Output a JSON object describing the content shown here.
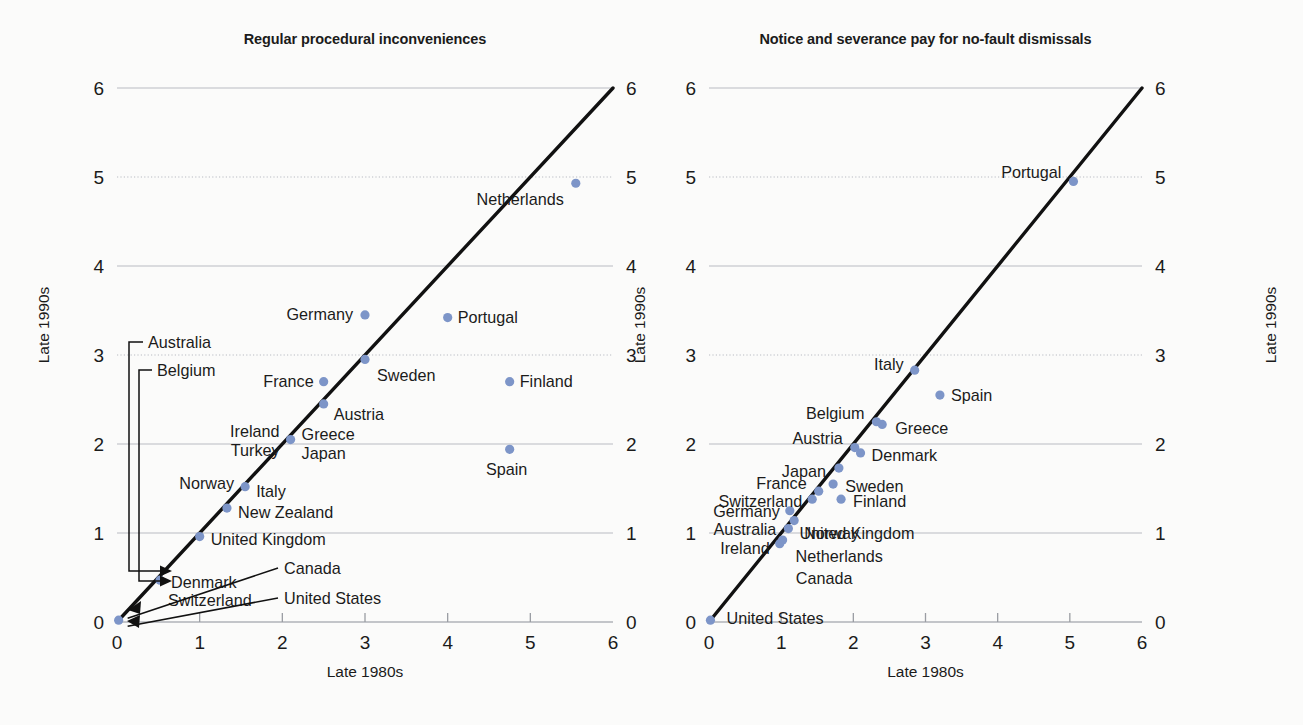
{
  "page": {
    "background_color": "#fbfbfa",
    "marker_color": "#7d95c8",
    "diagonal_color": "#111111"
  },
  "chart_data": [
    {
      "id": "left",
      "type": "scatter",
      "title": "Regular procedural inconveniences",
      "xlabel": "Late 1980s",
      "ylabel": "Late 1990s",
      "ylabel_right": "Late 1990s",
      "xlim": [
        0,
        6
      ],
      "ylim": [
        0,
        6
      ],
      "xticks": [
        0,
        1,
        2,
        3,
        4,
        5,
        6
      ],
      "yticks": [
        0,
        1,
        2,
        3,
        4,
        5,
        6
      ],
      "grid": true,
      "legend": "none",
      "reference_line": {
        "label": "45-degree line",
        "from": [
          0,
          0
        ],
        "to": [
          6,
          6
        ]
      },
      "points": [
        {
          "name": "Netherlands",
          "x": 5.55,
          "y": 4.93
        },
        {
          "name": "Germany",
          "x": 3.0,
          "y": 3.45
        },
        {
          "name": "Portugal",
          "x": 4.0,
          "y": 3.42
        },
        {
          "name": "Sweden",
          "x": 3.0,
          "y": 2.95
        },
        {
          "name": "France",
          "x": 2.5,
          "y": 2.7
        },
        {
          "name": "Finland",
          "x": 4.75,
          "y": 2.7
        },
        {
          "name": "Austria",
          "x": 2.5,
          "y": 2.45
        },
        {
          "name": "Greece",
          "x": 2.1,
          "y": 2.05
        },
        {
          "name": "Ireland",
          "x": 2.1,
          "y": 2.05
        },
        {
          "name": "Turkey",
          "x": 2.1,
          "y": 2.05
        },
        {
          "name": "Japan",
          "x": 2.1,
          "y": 2.05
        },
        {
          "name": "Spain",
          "x": 4.75,
          "y": 1.94
        },
        {
          "name": "Italy",
          "x": 1.55,
          "y": 1.52
        },
        {
          "name": "Norway",
          "x": 1.55,
          "y": 1.52
        },
        {
          "name": "New Zealand",
          "x": 1.33,
          "y": 1.28
        },
        {
          "name": "United Kingdom",
          "x": 1.0,
          "y": 0.96
        },
        {
          "name": "Denmark",
          "x": 0.52,
          "y": 0.47
        },
        {
          "name": "Switzerland",
          "x": 0.52,
          "y": 0.47
        },
        {
          "name": "Australia",
          "x": 0.02,
          "y": 0.02
        },
        {
          "name": "Belgium",
          "x": 0.02,
          "y": 0.02
        },
        {
          "name": "Canada",
          "x": 0.02,
          "y": 0.02
        },
        {
          "name": "United States",
          "x": 0.02,
          "y": 0.02
        }
      ],
      "annotated_labels": [
        {
          "name": "Australia",
          "style": "bracket-to-origin-cluster"
        },
        {
          "name": "Belgium",
          "style": "bracket-to-origin-cluster"
        },
        {
          "name": "Canada",
          "style": "arrow-to-origin"
        },
        {
          "name": "United States",
          "style": "arrow-to-origin"
        }
      ]
    },
    {
      "id": "right",
      "type": "scatter",
      "title": "Notice and severance pay for no-fault dismissals",
      "xlabel": "Late 1980s",
      "ylabel": "Late 1990s",
      "ylabel_right": "Late 1990s",
      "xlim": [
        0,
        6
      ],
      "ylim": [
        0,
        6
      ],
      "xticks": [
        0,
        1,
        2,
        3,
        4,
        5,
        6
      ],
      "yticks": [
        0,
        1,
        2,
        3,
        4,
        5,
        6
      ],
      "grid": true,
      "legend": "none",
      "reference_line": {
        "label": "45-degree line",
        "from": [
          0,
          0
        ],
        "to": [
          6,
          6
        ]
      },
      "points": [
        {
          "name": "Portugal",
          "x": 5.05,
          "y": 4.95
        },
        {
          "name": "Italy",
          "x": 2.85,
          "y": 2.83
        },
        {
          "name": "Spain",
          "x": 3.2,
          "y": 2.55
        },
        {
          "name": "Belgium",
          "x": 2.32,
          "y": 2.25
        },
        {
          "name": "Greece",
          "x": 2.4,
          "y": 2.22
        },
        {
          "name": "Austria",
          "x": 2.02,
          "y": 1.96
        },
        {
          "name": "Denmark",
          "x": 2.1,
          "y": 1.9
        },
        {
          "name": "Japan",
          "x": 1.8,
          "y": 1.73
        },
        {
          "name": "Sweden",
          "x": 1.72,
          "y": 1.55
        },
        {
          "name": "France",
          "x": 1.52,
          "y": 1.47
        },
        {
          "name": "Finland",
          "x": 1.83,
          "y": 1.38
        },
        {
          "name": "Switzerland",
          "x": 1.43,
          "y": 1.38
        },
        {
          "name": "Germany",
          "x": 1.12,
          "y": 1.25
        },
        {
          "name": "Norway",
          "x": 1.18,
          "y": 1.14
        },
        {
          "name": "Australia",
          "x": 1.1,
          "y": 1.05
        },
        {
          "name": "United Kingdom",
          "x": 1.1,
          "y": 1.05
        },
        {
          "name": "Netherlands",
          "x": 1.02,
          "y": 0.92
        },
        {
          "name": "Ireland",
          "x": 0.98,
          "y": 0.88
        },
        {
          "name": "Canada",
          "x": 0.98,
          "y": 0.88
        },
        {
          "name": "United States",
          "x": 0.02,
          "y": 0.02
        }
      ],
      "annotated_labels": []
    }
  ]
}
